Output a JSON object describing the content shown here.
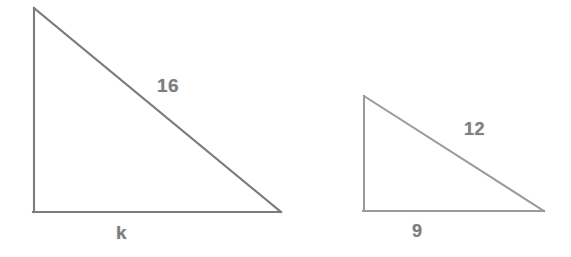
{
  "figure": {
    "background_color": "#ffffff",
    "stroke_color": "#6b6b6b",
    "label_color": "#6a6a6a",
    "triangles": [
      {
        "name": "large-triangle",
        "vertices": {
          "apex": [
            34,
            8
          ],
          "bottom_left": [
            34,
            212
          ],
          "bottom_right": [
            281,
            212
          ]
        },
        "labels": {
          "hypotenuse": "16",
          "base": "k",
          "vertical": ""
        }
      },
      {
        "name": "small-triangle",
        "vertices": {
          "apex": [
            364,
            96
          ],
          "bottom_left": [
            364,
            211
          ],
          "bottom_right": [
            544,
            211
          ]
        },
        "labels": {
          "hypotenuse": "12",
          "base": "9",
          "vertical": ""
        }
      }
    ],
    "labels": {
      "large_hypotenuse": "16",
      "large_base": "k",
      "small_hypotenuse": "12",
      "small_base": "9"
    }
  }
}
